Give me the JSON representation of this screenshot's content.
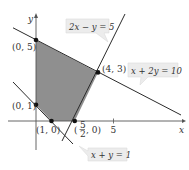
{
  "figure": {
    "type": "linear-programming-feasible-region",
    "axes": {
      "x_label": "x",
      "y_label": "y",
      "x_ticks": [
        {
          "value": 5,
          "label": "5"
        }
      ]
    },
    "lines": [
      {
        "equation": "2x − y = 5",
        "label": "2x − y = 5"
      },
      {
        "equation": "x + 2y = 10",
        "label": "x + 2y = 10"
      },
      {
        "equation": "x + y = 1",
        "label": "x + y = 1"
      }
    ],
    "vertices": [
      {
        "x": 0,
        "y": 5,
        "label": "(0, 5)"
      },
      {
        "x": 4,
        "y": 3,
        "label": "(4, 3)"
      },
      {
        "x": 2.5,
        "y": 0,
        "label_pre": "(",
        "frac_num": "5",
        "frac_den": "2",
        "label_post": ", 0)"
      },
      {
        "x": 1,
        "y": 0,
        "label": "(1, 0)"
      },
      {
        "x": 0,
        "y": 1,
        "label": "(0, 1)"
      }
    ],
    "colors": {
      "region_fill": "#8c8c8c",
      "line": "#2b2b2b",
      "axis": "#444444",
      "label_box": "#ececec"
    }
  }
}
